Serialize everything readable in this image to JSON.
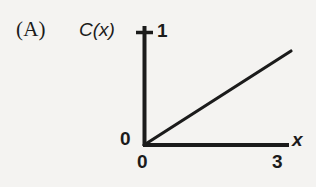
{
  "figure": {
    "panel_label": "(A)",
    "background_color": "#f4f3f1",
    "ink_color": "#1b1b1b"
  },
  "chart_data": {
    "type": "line",
    "title": "(A)",
    "xlabel": "x",
    "ylabel": "C(x)",
    "xlim": [
      0,
      3
    ],
    "ylim": [
      0,
      1
    ],
    "grid": false,
    "legend": null,
    "x_tick_labels": [
      "0",
      "3"
    ],
    "x_tick_values": [
      0,
      3
    ],
    "y_tick_labels": [
      "0",
      "1"
    ],
    "y_tick_values": [
      0,
      1
    ],
    "series": [
      {
        "name": "C(x)",
        "x": [
          0,
          3
        ],
        "values": [
          0,
          1
        ],
        "description": "straight line rising from the origin to (3, 1)"
      }
    ],
    "annotations": []
  },
  "labels": {
    "panel": "(A)",
    "y_axis_name": "C(x)",
    "x_axis_name": "x",
    "y_max_tick": "1",
    "y_zero_tick": "0",
    "x_zero_tick": "0",
    "x_max_tick": "3"
  },
  "geometry": {
    "origin_x": 144,
    "origin_y": 145,
    "y_axis_top": 26,
    "x_axis_right": 289,
    "y_one_level": 32,
    "line_end_x": 291,
    "line_end_y": 51
  }
}
